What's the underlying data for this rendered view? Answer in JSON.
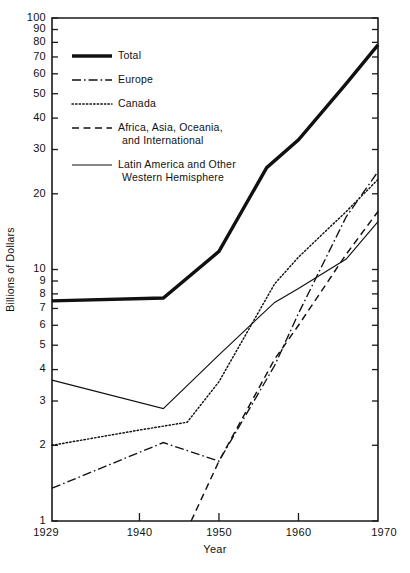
{
  "chart_data": {
    "type": "line",
    "title": "",
    "xlabel": "Year",
    "ylabel": "Billions of Dollars",
    "yscale": "log",
    "ylim": [
      1,
      100
    ],
    "xlim": [
      1929,
      1970
    ],
    "grid": false,
    "legend_position": "top-left",
    "y_major_ticks": [
      1,
      2,
      3,
      4,
      5,
      6,
      7,
      8,
      9,
      10,
      20,
      30,
      40,
      50,
      60,
      70,
      80,
      90,
      100
    ],
    "y_tick_labels": [
      "1",
      "2",
      "3",
      "4",
      "5",
      "6",
      "7",
      "8",
      "9",
      "10",
      "20",
      "30",
      "40",
      "50",
      "60",
      "70",
      "80",
      "90",
      "100"
    ],
    "x_ticks": [
      1929,
      1940,
      1950,
      1960,
      1970
    ],
    "x_tick_labels": [
      "1929",
      "1940",
      "1950",
      "1960",
      "1970"
    ],
    "series": [
      {
        "name": "Total",
        "style": "thick-solid",
        "x": [
          1929,
          1943,
          1950,
          1956,
          1960,
          1966,
          1970
        ],
        "values": [
          7.5,
          7.7,
          11.8,
          25.4,
          32.8,
          54.8,
          78.2
        ]
      },
      {
        "name": "Europe",
        "style": "dash-dot",
        "x": [
          1929,
          1943,
          1950,
          1957,
          1960,
          1966,
          1970
        ],
        "values": [
          1.35,
          2.05,
          1.73,
          4.15,
          6.69,
          16.2,
          24.5
        ]
      },
      {
        "name": "Canada",
        "style": "dotted",
        "x": [
          1929,
          1940,
          1946,
          1950,
          1957,
          1960,
          1966,
          1970
        ],
        "values": [
          2.0,
          2.3,
          2.47,
          3.58,
          8.77,
          11.2,
          17.0,
          22.8
        ]
      },
      {
        "name": "Africa, Asia, Oceania, and International",
        "style": "dashed",
        "x": [
          1946.5,
          1950,
          1957,
          1960,
          1966,
          1970
        ],
        "values": [
          1.0,
          1.73,
          4.4,
          6.0,
          11.5,
          17.0
        ]
      },
      {
        "name": "Latin America and Other Western Hemisphere",
        "style": "thin-solid",
        "x": [
          1929,
          1943,
          1950,
          1957,
          1960,
          1966,
          1970
        ],
        "values": [
          3.63,
          2.8,
          4.58,
          7.4,
          8.4,
          11.0,
          15.5
        ]
      }
    ]
  },
  "legend": {
    "items": [
      {
        "label": "Total",
        "style": "thick-solid"
      },
      {
        "label": "Europe",
        "style": "dash-dot"
      },
      {
        "label": "Canada",
        "style": "dotted"
      },
      {
        "label": "Africa, Asia, Oceania,",
        "label2": "and International",
        "style": "dashed"
      },
      {
        "label": "Latin America and Other",
        "label2": "Western Hemisphere",
        "style": "thin-solid"
      }
    ]
  },
  "colors": {
    "ink": "#111111",
    "background": "#ffffff"
  }
}
